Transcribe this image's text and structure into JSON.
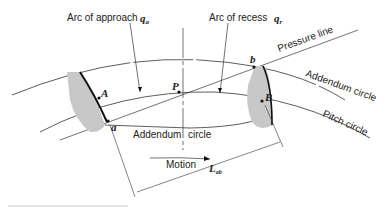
{
  "diagram": {
    "labels": {
      "arc_of_approach": "Arc of approach",
      "arc_of_approach_symbol": "q",
      "arc_of_approach_sub": "a",
      "arc_of_recess": "Arc of recess",
      "arc_of_recess_symbol": "q",
      "arc_of_recess_sub": "r",
      "pressure_line": "Pressure line",
      "addendum_circle_right": "Addendum circle",
      "addendum_circle_bottom_1": "Addendum",
      "addendum_circle_bottom_2": "circle",
      "pitch_circle": "Pitch circle",
      "motion": "Motion",
      "length": "L",
      "length_sub": "ab",
      "point_P": "P",
      "point_A": "A",
      "point_B": "B",
      "point_a": "a",
      "point_b": "b"
    },
    "colors": {
      "line": "#333333",
      "tooth_fill": "#c8c8c8"
    }
  }
}
